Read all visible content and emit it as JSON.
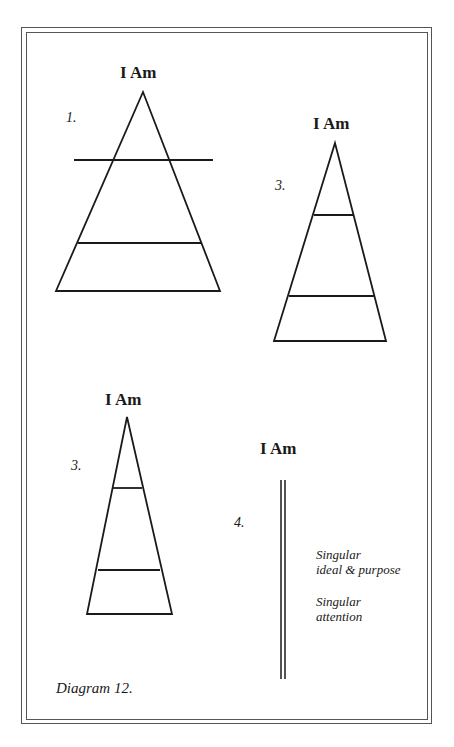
{
  "diagrams": [
    {
      "number": "1.",
      "title": "I Am"
    },
    {
      "number": "2.",
      "title": "I Am"
    },
    {
      "number": "3.",
      "title": "I Am"
    },
    {
      "number": "4.",
      "title": "I Am",
      "notes": [
        {
          "line1": "Singular",
          "line2": "ideal & purpose"
        },
        {
          "line1": "Singular",
          "line2": "attention"
        }
      ]
    }
  ],
  "caption": "Diagram 12.",
  "colors": {
    "line": "#1a1a1a",
    "frame": "#555555",
    "background": "#ffffff"
  }
}
